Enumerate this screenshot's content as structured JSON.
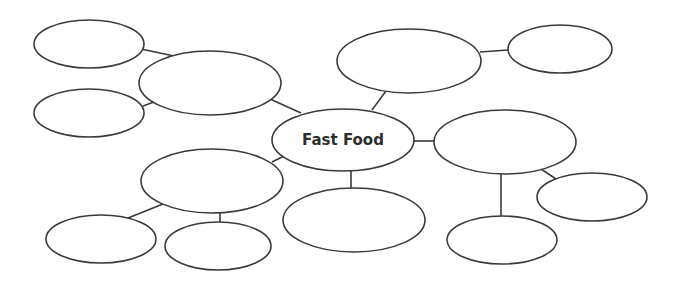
{
  "diagram": {
    "type": "mind-map",
    "title": "Fast Food",
    "central_node": {
      "id": "center",
      "label": "Fast Food",
      "cx": 343,
      "cy": 140,
      "rx": 71,
      "ry": 31
    },
    "nodes": [
      {
        "id": "top-left-leaf",
        "label": "",
        "cx": 89,
        "cy": 44,
        "rx": 55,
        "ry": 24
      },
      {
        "id": "mid-left-leaf",
        "label": "",
        "cx": 89,
        "cy": 113,
        "rx": 55,
        "ry": 24
      },
      {
        "id": "upper-left-branch",
        "label": "",
        "cx": 210,
        "cy": 83,
        "rx": 71,
        "ry": 32
      },
      {
        "id": "top-center-branch",
        "label": "",
        "cx": 409,
        "cy": 61,
        "rx": 72,
        "ry": 32
      },
      {
        "id": "top-right-leaf",
        "label": "",
        "cx": 560,
        "cy": 49,
        "rx": 52,
        "ry": 24
      },
      {
        "id": "right-branch",
        "label": "",
        "cx": 505,
        "cy": 142,
        "rx": 71,
        "ry": 32
      },
      {
        "id": "bottom-right-leaf",
        "label": "",
        "cx": 592,
        "cy": 197,
        "rx": 55,
        "ry": 24
      },
      {
        "id": "bottom-right-lower-leaf",
        "label": "",
        "cx": 502,
        "cy": 240,
        "rx": 55,
        "ry": 24
      },
      {
        "id": "bottom-center-branch",
        "label": "",
        "cx": 354,
        "cy": 220,
        "rx": 71,
        "ry": 32
      },
      {
        "id": "lower-left-branch",
        "label": "",
        "cx": 212,
        "cy": 181,
        "rx": 71,
        "ry": 32
      },
      {
        "id": "bottom-left-leaf",
        "label": "",
        "cx": 101,
        "cy": 239,
        "rx": 55,
        "ry": 24
      },
      {
        "id": "bottom-left-mid-leaf",
        "label": "",
        "cx": 218,
        "cy": 246,
        "rx": 53,
        "ry": 24
      }
    ],
    "edges": [
      {
        "from": "top-left-leaf",
        "to": "upper-left-branch",
        "x1": 141,
        "y1": 49,
        "x2": 174,
        "y2": 56
      },
      {
        "from": "mid-left-leaf",
        "to": "upper-left-branch",
        "x1": 143,
        "y1": 106,
        "x2": 154,
        "y2": 102
      },
      {
        "from": "upper-left-branch",
        "to": "center",
        "x1": 270,
        "y1": 99,
        "x2": 301,
        "y2": 113
      },
      {
        "from": "top-center-branch",
        "to": "center",
        "x1": 386,
        "y1": 91,
        "x2": 372,
        "y2": 110
      },
      {
        "from": "top-center-branch",
        "to": "top-right-leaf",
        "x1": 480,
        "y1": 52,
        "x2": 508,
        "y2": 50
      },
      {
        "from": "center",
        "to": "right-branch",
        "x1": 414,
        "y1": 141,
        "x2": 434,
        "y2": 141
      },
      {
        "from": "right-branch",
        "to": "bottom-right-leaf",
        "x1": 541,
        "y1": 169,
        "x2": 556,
        "y2": 179
      },
      {
        "from": "right-branch",
        "to": "bottom-right-lower-leaf",
        "x1": 501,
        "y1": 174,
        "x2": 501,
        "y2": 216
      },
      {
        "from": "center",
        "to": "bottom-center-branch",
        "x1": 351,
        "y1": 171,
        "x2": 351,
        "y2": 188
      },
      {
        "from": "center",
        "to": "lower-left-branch",
        "x1": 272,
        "y1": 162,
        "x2": 284,
        "y2": 156
      },
      {
        "from": "lower-left-branch",
        "to": "bottom-left-leaf",
        "x1": 128,
        "y1": 218,
        "x2": 163,
        "y2": 204
      },
      {
        "from": "lower-left-branch",
        "to": "bottom-left-mid-leaf",
        "x1": 220,
        "y1": 213,
        "x2": 220,
        "y2": 222
      }
    ],
    "colors": {
      "stroke": "#3a3a3a",
      "fill": "#ffffff",
      "text": "#2e2e2e",
      "background": "#ffffff"
    }
  }
}
